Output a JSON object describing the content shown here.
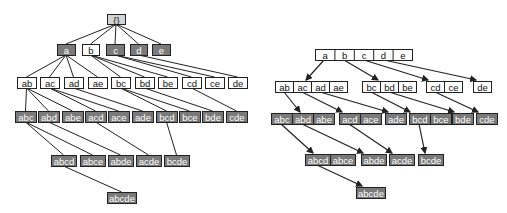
{
  "colors": {
    "edge": "#222222",
    "node_border": "#222222",
    "root_fill": "#d4d4d4",
    "dark_fill": "#7a7a7a",
    "white_fill": "#ffffff",
    "text_dark": "#111111",
    "text_light": "#ffffff"
  },
  "left_tree": {
    "title": "Set enumeration tree",
    "nodes": [
      {
        "id": "root",
        "label": "{}",
        "x": 107,
        "y": 14,
        "w": 18,
        "h": 10,
        "fill": "root"
      },
      {
        "id": "a",
        "label": "a",
        "x": 57,
        "y": 44,
        "w": 18,
        "h": 11,
        "fill": "dark"
      },
      {
        "id": "b",
        "label": "b",
        "x": 82,
        "y": 44,
        "w": 17,
        "h": 11,
        "fill": "white"
      },
      {
        "id": "c",
        "label": "c",
        "x": 106,
        "y": 44,
        "w": 18,
        "h": 11,
        "fill": "dark"
      },
      {
        "id": "d",
        "label": "d",
        "x": 130,
        "y": 44,
        "w": 17,
        "h": 11,
        "fill": "dark"
      },
      {
        "id": "e",
        "label": "e",
        "x": 152,
        "y": 44,
        "w": 18,
        "h": 11,
        "fill": "dark"
      },
      {
        "id": "ab",
        "label": "ab",
        "x": 17,
        "y": 77,
        "w": 19,
        "h": 11,
        "fill": "white"
      },
      {
        "id": "ac",
        "label": "ac",
        "x": 40,
        "y": 77,
        "w": 19,
        "h": 11,
        "fill": "white"
      },
      {
        "id": "ad",
        "label": "ad",
        "x": 64,
        "y": 77,
        "w": 19,
        "h": 11,
        "fill": "white"
      },
      {
        "id": "ae",
        "label": "ae",
        "x": 88,
        "y": 77,
        "w": 19,
        "h": 11,
        "fill": "white"
      },
      {
        "id": "bc",
        "label": "bc",
        "x": 111,
        "y": 77,
        "w": 19,
        "h": 11,
        "fill": "white"
      },
      {
        "id": "bd",
        "label": "bd",
        "x": 135,
        "y": 77,
        "w": 19,
        "h": 11,
        "fill": "white"
      },
      {
        "id": "be",
        "label": "be",
        "x": 158,
        "y": 77,
        "w": 19,
        "h": 11,
        "fill": "white"
      },
      {
        "id": "cd",
        "label": "cd",
        "x": 182,
        "y": 77,
        "w": 19,
        "h": 11,
        "fill": "white"
      },
      {
        "id": "ce",
        "label": "ce",
        "x": 205,
        "y": 77,
        "w": 19,
        "h": 11,
        "fill": "white"
      },
      {
        "id": "de",
        "label": "de",
        "x": 228,
        "y": 77,
        "w": 19,
        "h": 11,
        "fill": "white"
      },
      {
        "id": "abc",
        "label": "abc",
        "x": 15,
        "y": 111,
        "w": 21,
        "h": 11,
        "fill": "dark"
      },
      {
        "id": "abd",
        "label": "abd",
        "x": 38,
        "y": 111,
        "w": 21,
        "h": 11,
        "fill": "dark"
      },
      {
        "id": "abe",
        "label": "abe",
        "x": 62,
        "y": 111,
        "w": 21,
        "h": 11,
        "fill": "dark"
      },
      {
        "id": "acd",
        "label": "acd",
        "x": 85,
        "y": 111,
        "w": 21,
        "h": 11,
        "fill": "dark"
      },
      {
        "id": "ace",
        "label": "ace",
        "x": 108,
        "y": 111,
        "w": 21,
        "h": 11,
        "fill": "dark"
      },
      {
        "id": "ade",
        "label": "ade",
        "x": 132,
        "y": 111,
        "w": 21,
        "h": 11,
        "fill": "dark"
      },
      {
        "id": "bcd",
        "label": "bcd",
        "x": 156,
        "y": 111,
        "w": 21,
        "h": 11,
        "fill": "dark"
      },
      {
        "id": "bce",
        "label": "bce",
        "x": 179,
        "y": 111,
        "w": 21,
        "h": 11,
        "fill": "dark"
      },
      {
        "id": "bde",
        "label": "bde",
        "x": 202,
        "y": 111,
        "w": 21,
        "h": 11,
        "fill": "dark"
      },
      {
        "id": "cde",
        "label": "cde",
        "x": 226,
        "y": 111,
        "w": 21,
        "h": 11,
        "fill": "dark"
      },
      {
        "id": "abcd",
        "label": "abcd",
        "x": 51,
        "y": 155,
        "w": 25,
        "h": 11,
        "fill": "dark"
      },
      {
        "id": "abce",
        "label": "abce",
        "x": 80,
        "y": 155,
        "w": 25,
        "h": 11,
        "fill": "dark"
      },
      {
        "id": "abde",
        "label": "abde",
        "x": 108,
        "y": 155,
        "w": 25,
        "h": 11,
        "fill": "dark"
      },
      {
        "id": "acde",
        "label": "acde",
        "x": 136,
        "y": 155,
        "w": 25,
        "h": 11,
        "fill": "dark"
      },
      {
        "id": "bcde",
        "label": "bcde",
        "x": 164,
        "y": 155,
        "w": 25,
        "h": 11,
        "fill": "dark"
      },
      {
        "id": "abcde",
        "label": "abcde",
        "x": 107,
        "y": 192,
        "w": 29,
        "h": 11,
        "fill": "dark"
      }
    ],
    "edges": [
      [
        "root",
        "a"
      ],
      [
        "root",
        "b"
      ],
      [
        "root",
        "c"
      ],
      [
        "root",
        "d"
      ],
      [
        "root",
        "e"
      ],
      [
        "a",
        "ab"
      ],
      [
        "a",
        "ac"
      ],
      [
        "a",
        "ad"
      ],
      [
        "a",
        "ae"
      ],
      [
        "b",
        "bc"
      ],
      [
        "b",
        "bd"
      ],
      [
        "b",
        "be"
      ],
      [
        "c",
        "cd"
      ],
      [
        "c",
        "ce"
      ],
      [
        "d",
        "de"
      ],
      [
        "ab",
        "abc"
      ],
      [
        "ab",
        "abd"
      ],
      [
        "ab",
        "abe"
      ],
      [
        "ac",
        "acd"
      ],
      [
        "ac",
        "ace"
      ],
      [
        "ad",
        "ade"
      ],
      [
        "bc",
        "bcd"
      ],
      [
        "bc",
        "bce"
      ],
      [
        "bd",
        "bde"
      ],
      [
        "cd",
        "cde"
      ],
      [
        "abc",
        "abcd"
      ],
      [
        "abc",
        "abce"
      ],
      [
        "abd",
        "abde"
      ],
      [
        "acd",
        "acde"
      ],
      [
        "bcd",
        "bcde"
      ],
      [
        "abcd",
        "abcde"
      ]
    ]
  },
  "right_tree": {
    "title": "Prefix-compressed enumeration tree",
    "groups": [
      {
        "id": "g1",
        "cells": [
          "a",
          "b",
          "c",
          "d",
          "e"
        ],
        "x": 315,
        "y": 49,
        "cell_w": 19.4,
        "h": 11,
        "fill": "white"
      },
      {
        "id": "g_ab",
        "cells": [
          "ab",
          "ac",
          "ad",
          "ae"
        ],
        "x": 275,
        "y": 81,
        "cell_w": 18,
        "h": 11,
        "fill": "white"
      },
      {
        "id": "g_bc",
        "cells": [
          "bc",
          "bd",
          "be"
        ],
        "x": 362,
        "y": 81,
        "cell_w": 18,
        "h": 11,
        "fill": "white"
      },
      {
        "id": "g_cd",
        "cells": [
          "cd",
          "ce"
        ],
        "x": 426,
        "y": 81,
        "cell_w": 18,
        "h": 11,
        "fill": "white"
      },
      {
        "id": "g_de",
        "cells": [
          "de"
        ],
        "x": 473,
        "y": 81,
        "cell_w": 18,
        "h": 11,
        "fill": "white"
      },
      {
        "id": "g_abc",
        "cells": [
          "abc",
          "abd",
          "abe"
        ],
        "x": 271,
        "y": 113,
        "cell_w": 21,
        "h": 11,
        "fill": "dark"
      },
      {
        "id": "g_acd",
        "cells": [
          "acd",
          "ace"
        ],
        "x": 339,
        "y": 113,
        "cell_w": 21,
        "h": 11,
        "fill": "dark"
      },
      {
        "id": "g_ade",
        "cells": [
          "ade"
        ],
        "x": 385,
        "y": 113,
        "cell_w": 21,
        "h": 11,
        "fill": "dark"
      },
      {
        "id": "g_bcd",
        "cells": [
          "bcd",
          "bce"
        ],
        "x": 409,
        "y": 113,
        "cell_w": 21,
        "h": 11,
        "fill": "dark"
      },
      {
        "id": "g_bde",
        "cells": [
          "bde"
        ],
        "x": 452,
        "y": 113,
        "cell_w": 21,
        "h": 11,
        "fill": "dark"
      },
      {
        "id": "g_cde",
        "cells": [
          "cde"
        ],
        "x": 476,
        "y": 113,
        "cell_w": 21,
        "h": 11,
        "fill": "dark"
      },
      {
        "id": "g_abcd",
        "cells": [
          "abcd",
          "abce"
        ],
        "x": 305,
        "y": 154,
        "cell_w": 25,
        "h": 11,
        "fill": "dark"
      },
      {
        "id": "g_abde",
        "cells": [
          "abde"
        ],
        "x": 361,
        "y": 154,
        "cell_w": 25,
        "h": 11,
        "fill": "dark"
      },
      {
        "id": "g_acde",
        "cells": [
          "acde"
        ],
        "x": 389,
        "y": 154,
        "cell_w": 25,
        "h": 11,
        "fill": "dark"
      },
      {
        "id": "g_bcde",
        "cells": [
          "bcde"
        ],
        "x": 418,
        "y": 154,
        "cell_w": 25,
        "h": 11,
        "fill": "dark"
      },
      {
        "id": "g_abcde",
        "cells": [
          "abcde"
        ],
        "x": 356,
        "y": 187,
        "cell_w": 29,
        "h": 11,
        "fill": "dark"
      }
    ],
    "arrows": [
      {
        "from": [
          324,
          60
        ],
        "to": [
          306,
          80
        ]
      },
      {
        "from": [
          344,
          60
        ],
        "to": [
          378,
          80
        ]
      },
      {
        "from": [
          364,
          60
        ],
        "to": [
          428,
          80
        ]
      },
      {
        "from": [
          384,
          60
        ],
        "to": [
          476,
          80
        ]
      },
      {
        "from": [
          284,
          92
        ],
        "to": [
          300,
          112
        ]
      },
      {
        "from": [
          302,
          92
        ],
        "to": [
          342,
          112
        ]
      },
      {
        "from": [
          320,
          92
        ],
        "to": [
          388,
          112
        ]
      },
      {
        "from": [
          371,
          92
        ],
        "to": [
          410,
          112
        ]
      },
      {
        "from": [
          389,
          92
        ],
        "to": [
          454,
          112
        ]
      },
      {
        "from": [
          435,
          92
        ],
        "to": [
          478,
          112
        ]
      },
      {
        "from": [
          281,
          124
        ],
        "to": [
          313,
          153
        ]
      },
      {
        "from": [
          302,
          124
        ],
        "to": [
          363,
          153
        ]
      },
      {
        "from": [
          349,
          124
        ],
        "to": [
          392,
          153
        ]
      },
      {
        "from": [
          419,
          124
        ],
        "to": [
          425,
          153
        ]
      },
      {
        "from": [
          317,
          165
        ],
        "to": [
          362,
          186
        ]
      }
    ]
  }
}
